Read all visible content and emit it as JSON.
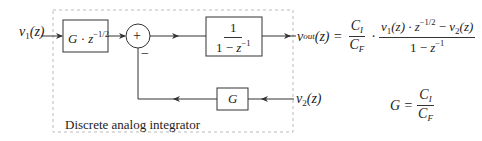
{
  "diagram": {
    "title_label": "Discrete analog integrator",
    "input1": {
      "v": "v",
      "sub": "1",
      "arg": "(z)"
    },
    "input2": {
      "v": "v",
      "sub": "2",
      "arg": "(z)"
    },
    "block_delay": {
      "G": "G",
      "dot": "·",
      "z": "z",
      "exp": "−1/2"
    },
    "sum_node": {
      "symbol": "+",
      "minus": "−"
    },
    "block_integrator": {
      "num": "1",
      "den_prefix": "1 − ",
      "z": "z",
      "exp": "−1"
    },
    "block_gain": {
      "G": "G"
    },
    "output_equation": {
      "lhs_v": "v",
      "lhs_sub": "out",
      "lhs_arg": "(z) =",
      "c_num": "C",
      "c_num_sub": "I",
      "c_den": "C",
      "c_den_sub": "F",
      "dot": "·",
      "num_v1": "v",
      "num_v1_sub": "1",
      "num_v1_arg": "(z) · ",
      "num_z": "z",
      "num_z_exp": "−1/2",
      "num_minus": " − ",
      "num_v2": "v",
      "num_v2_sub": "2",
      "num_v2_arg": "(z)",
      "den_prefix": "1 − ",
      "den_z": "z",
      "den_exp": "−1"
    },
    "gain_equation": {
      "lhs": "G =",
      "num": "C",
      "num_sub": "I",
      "den": "C",
      "den_sub": "F"
    }
  },
  "colors": {
    "line": "#333333",
    "dashed_box": "#bbbbbb",
    "text": "#222222"
  }
}
